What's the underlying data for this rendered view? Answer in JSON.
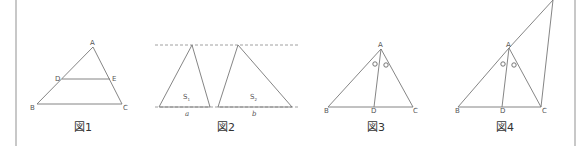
{
  "figures": [
    {
      "caption": "図1",
      "points": {
        "A": "A",
        "B": "B",
        "C": "C",
        "D": "D",
        "E": "E"
      }
    },
    {
      "caption": "図2",
      "areas": {
        "s1": "S",
        "s1_sub": "1",
        "s2": "S",
        "s2_sub": "2"
      },
      "bases": {
        "a": "a",
        "b": "b"
      }
    },
    {
      "caption": "図3",
      "points": {
        "A": "A",
        "B": "B",
        "C": "C",
        "D": "D"
      },
      "angle_mark": "equal-angle-circles"
    },
    {
      "caption": "図4",
      "points": {
        "A": "A",
        "B": "B",
        "C": "C",
        "D": "D"
      },
      "angle_mark": "equal-angle-circles"
    }
  ],
  "colors": {
    "line": "#777777",
    "border": "#c8c8c8",
    "text": "#333333"
  }
}
